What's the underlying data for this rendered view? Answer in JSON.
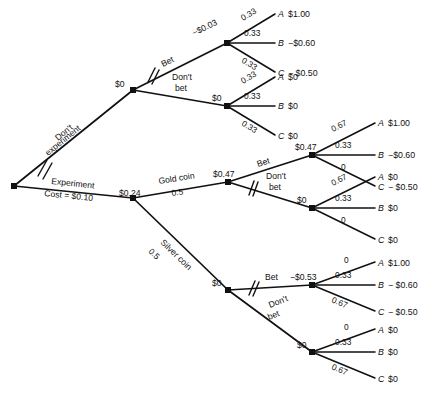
{
  "diagram": {
    "type": "decision-tree",
    "root": {
      "value_label": "",
      "position": [
        14,
        186
      ]
    },
    "branches": {
      "dont_experiment": {
        "label_line1": "Don't",
        "label_line2": "experiment",
        "pruned": true
      },
      "experiment": {
        "label_line1": "Experiment",
        "label_line2": "Cost = $0.10",
        "value": "$0.24",
        "pruned": false
      },
      "bet": {
        "label": "Bet"
      },
      "dont_bet_line1": "Don't",
      "dont_bet_line2": "bet",
      "gold_coin": {
        "label": "Gold coin",
        "probability": "0.5",
        "value": "$0.47"
      },
      "silver_coin": {
        "label": "Silver coin",
        "probability": "0.5",
        "value": "$0"
      }
    },
    "nodes": {
      "no_exp_decision": {
        "value": "$0"
      },
      "no_exp_bet": {
        "value": "−$0.03"
      },
      "no_exp_nobet": {
        "value": "$0"
      },
      "gold_bet": {
        "value": "$0.47"
      },
      "gold_nobet": {
        "value": "$0"
      },
      "silver_bet": {
        "value": "−$0.53"
      },
      "silver_nobet": {
        "value": "$0"
      }
    },
    "groups": [
      {
        "id": "no-experiment-bet",
        "node_value": "−$0.03",
        "outcomes": [
          {
            "prob": "0.33",
            "letter": "A",
            "payoff": "$1.00"
          },
          {
            "prob": "0.33",
            "letter": "B",
            "payoff": "−$0.60"
          },
          {
            "prob": "0.33",
            "letter": "C",
            "payoff": "− $0.50"
          }
        ]
      },
      {
        "id": "no-experiment-dont-bet",
        "node_value": "$0",
        "outcomes": [
          {
            "prob": "0.33",
            "letter": "A",
            "payoff": "$0"
          },
          {
            "prob": "0.33",
            "letter": "B",
            "payoff": "$0"
          },
          {
            "prob": "0.33",
            "letter": "C",
            "payoff": "$0"
          }
        ]
      },
      {
        "id": "gold-bet",
        "node_value": "$0.47",
        "outcomes": [
          {
            "prob": "0.67",
            "letter": "A",
            "payoff": "$1.00"
          },
          {
            "prob": "0.33",
            "letter": "B",
            "payoff": "−$0.60"
          },
          {
            "prob": "0",
            "letter": "C",
            "payoff": "− $0.50"
          }
        ]
      },
      {
        "id": "gold-dont-bet",
        "node_value": "$0",
        "outcomes": [
          {
            "prob": "0.67",
            "letter": "A",
            "payoff": "$0"
          },
          {
            "prob": "0.33",
            "letter": "B",
            "payoff": "$0"
          },
          {
            "prob": "0",
            "letter": "C",
            "payoff": "$0"
          }
        ]
      },
      {
        "id": "silver-bet",
        "node_value": "−$0.53",
        "outcomes": [
          {
            "prob": "0",
            "letter": "A",
            "payoff": "$1.00"
          },
          {
            "prob": "0.33",
            "letter": "B",
            "payoff": "− $0.60"
          },
          {
            "prob": "0.67",
            "letter": "C",
            "payoff": "− $0.50"
          }
        ]
      },
      {
        "id": "silver-dont-bet",
        "node_value": "$0",
        "outcomes": [
          {
            "prob": "0",
            "letter": "A",
            "payoff": "$0"
          },
          {
            "prob": "0.33",
            "letter": "B",
            "payoff": "$0"
          },
          {
            "prob": "0.67",
            "letter": "C",
            "payoff": "$0"
          }
        ]
      }
    ],
    "colors": {
      "line": "#111111",
      "background": "#ffffff",
      "text": "#111111"
    }
  }
}
